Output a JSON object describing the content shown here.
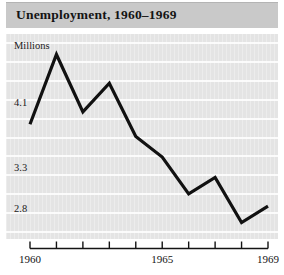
{
  "title": "Unemployment, 1960–1969",
  "colors": {
    "title_bar_bg": "#c9c9c9",
    "plot_bg": "#e4e4e4",
    "gridline": "#fbfbfb",
    "series_line": "#111111",
    "axis_line": "#141414",
    "text": "#141414"
  },
  "axes": {
    "y_units_label": "Millions",
    "y_ticks": [
      "4.1",
      "3.3",
      "2.8"
    ],
    "y_tick_values": [
      4.1,
      3.3,
      2.8
    ],
    "x_ticks_labeled": [
      "1960",
      "1965",
      "1969"
    ],
    "x_tick_values_labeled": [
      1960,
      1965,
      1969
    ],
    "x_ticks_all": [
      1960,
      1961,
      1962,
      1963,
      1964,
      1965,
      1966,
      1967,
      1968,
      1969
    ]
  },
  "chart_data": {
    "type": "line",
    "title": "Unemployment, 1960–1969",
    "xlabel": "",
    "ylabel": "Millions",
    "x": [
      1960,
      1961,
      1962,
      1963,
      1964,
      1965,
      1966,
      1967,
      1968,
      1969
    ],
    "categories": [
      "1960",
      "1961",
      "1962",
      "1963",
      "1964",
      "1965",
      "1966",
      "1967",
      "1968",
      "1969"
    ],
    "values": [
      3.85,
      4.7,
      4.0,
      4.35,
      3.7,
      3.45,
      3.0,
      3.2,
      2.65,
      2.85
    ],
    "series": [
      {
        "name": "Unemployment (millions)",
        "values": [
          3.85,
          4.7,
          4.0,
          4.35,
          3.7,
          3.45,
          3.0,
          3.2,
          2.65,
          2.85
        ]
      }
    ],
    "xlim": [
      1960,
      1969
    ],
    "ylim": [
      2.45,
      4.95
    ],
    "grid": "horizontal",
    "legend": "none",
    "line_color": "#111111",
    "line_width": 3,
    "markers": "none",
    "gridline_count": 11
  }
}
